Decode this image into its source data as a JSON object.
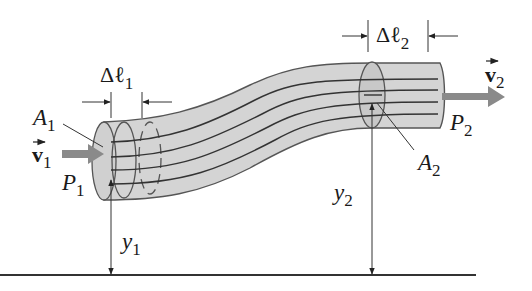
{
  "diagram": {
    "colors": {
      "tube_fill": "#d4d4d4",
      "outline": "#444444",
      "arrow_fill": "#8a8a8a",
      "ground": "#333333"
    },
    "labels": {
      "delta_l1": {
        "base": "Δℓ",
        "sub": "1"
      },
      "delta_l2": {
        "base": "Δℓ",
        "sub": "2"
      },
      "area1": {
        "base": "A",
        "sub": "1"
      },
      "area2": {
        "base": "A",
        "sub": "2"
      },
      "velocity1": {
        "base": "v",
        "sub": "1"
      },
      "velocity2": {
        "base": "v",
        "sub": "2"
      },
      "pressure1": {
        "base": "P",
        "sub": "1"
      },
      "pressure2": {
        "base": "P",
        "sub": "2"
      },
      "height1": {
        "base": "y",
        "sub": "1"
      },
      "height2": {
        "base": "y",
        "sub": "2"
      }
    }
  }
}
